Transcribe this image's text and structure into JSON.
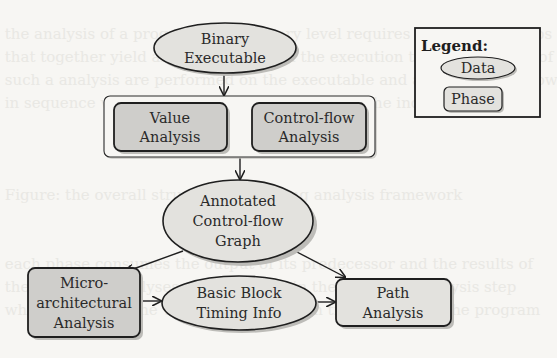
{
  "diagram": {
    "nodes": {
      "binary": {
        "type": "data",
        "line1": "Binary",
        "line2": "Executable"
      },
      "value": {
        "type": "phase",
        "line1": "Value",
        "line2": "Analysis"
      },
      "cflow": {
        "type": "phase",
        "line1": "Control-flow",
        "line2": "Analysis"
      },
      "cfg": {
        "type": "data",
        "line1": "Annotated",
        "line2": "Control-flow",
        "line3": "Graph"
      },
      "micro": {
        "type": "phase",
        "line1": "Micro-",
        "line2": "architectural",
        "line3": "Analysis"
      },
      "bbtiming": {
        "type": "data",
        "line1": "Basic Block",
        "line2": "Timing Info"
      },
      "path": {
        "type": "phase",
        "line1": "Path",
        "line2": "Analysis"
      }
    },
    "edges": [
      {
        "from": "binary",
        "to": "analysis-group"
      },
      {
        "from": "analysis-group",
        "to": "cfg"
      },
      {
        "from": "cfg",
        "to": "micro"
      },
      {
        "from": "cfg",
        "to": "path"
      },
      {
        "from": "micro",
        "to": "bbtiming"
      },
      {
        "from": "bbtiming",
        "to": "path"
      }
    ],
    "legend": {
      "title": "Legend:",
      "data_label": "Data",
      "phase_label": "Phase"
    }
  },
  "colors": {
    "background": "#f7f6f3",
    "node_fill": "#e3e2de",
    "phase_fill": "#cfcecb",
    "stroke": "#1f1f1f",
    "shadow": "#bdbcb8"
  }
}
